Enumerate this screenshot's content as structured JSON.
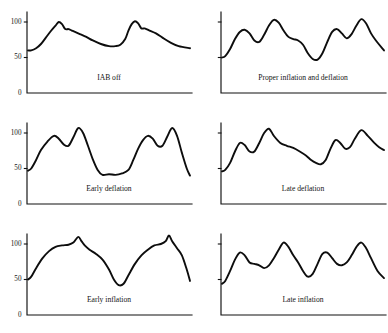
{
  "figure": {
    "title": "",
    "rows": 3,
    "columns": 2
  },
  "chart_data": [
    {
      "type": "line",
      "title": "IAB off",
      "panel_id": "iab-off",
      "position": {
        "row": 0,
        "col": 0
      },
      "xlabel": "",
      "ylabel": "",
      "ylim": [
        0,
        120
      ],
      "xlim": [
        0,
        100
      ],
      "grid": false,
      "legend": "none",
      "y_ticks": [
        0,
        50,
        100
      ],
      "y_tick_labels": [
        "0",
        "50",
        "100"
      ],
      "show_y_labels": true,
      "series": [
        {
          "name": "arterial pressure",
          "x": [
            0,
            2,
            5,
            8,
            11,
            14,
            17,
            19,
            21,
            23,
            25,
            27,
            29,
            32,
            36,
            40,
            45,
            50,
            54,
            57,
            60,
            62,
            64,
            66,
            68,
            70,
            72,
            75,
            79,
            83,
            88,
            93,
            100
          ],
          "values": [
            60,
            60,
            63,
            69,
            78,
            87,
            95,
            100,
            97,
            90,
            90,
            88,
            86,
            83,
            79,
            74,
            69,
            66,
            66,
            68,
            76,
            88,
            97,
            101,
            98,
            91,
            91,
            88,
            84,
            78,
            71,
            66,
            63
          ]
        }
      ]
    },
    {
      "type": "line",
      "title": "Proper inflation and deflation",
      "panel_id": "proper-inflation-and-deflation",
      "position": {
        "row": 0,
        "col": 1
      },
      "xlabel": "",
      "ylabel": "",
      "ylim": [
        0,
        120
      ],
      "xlim": [
        0,
        100
      ],
      "grid": false,
      "legend": "none",
      "y_ticks": [
        0,
        50,
        100
      ],
      "y_tick_labels": [
        "",
        "",
        ""
      ],
      "show_y_labels": false,
      "series": [
        {
          "name": "arterial pressure",
          "x": [
            0,
            2,
            5,
            8,
            11,
            14,
            17,
            20,
            23,
            26,
            29,
            32,
            35,
            38,
            41,
            44,
            47,
            50,
            53,
            56,
            59,
            62,
            65,
            68,
            71,
            74,
            77,
            80,
            83,
            86,
            89,
            92,
            95,
            100
          ],
          "values": [
            50,
            52,
            62,
            76,
            86,
            89,
            84,
            74,
            72,
            82,
            95,
            103,
            99,
            88,
            79,
            76,
            74,
            68,
            56,
            48,
            47,
            56,
            72,
            86,
            90,
            84,
            77,
            83,
            95,
            104,
            98,
            84,
            74,
            60
          ]
        }
      ]
    },
    {
      "type": "line",
      "title": "Early deflation",
      "panel_id": "early-deflation",
      "position": {
        "row": 1,
        "col": 0
      },
      "xlabel": "",
      "ylabel": "",
      "ylim": [
        0,
        120
      ],
      "xlim": [
        0,
        100
      ],
      "grid": false,
      "legend": "none",
      "y_ticks": [
        0,
        50,
        100
      ],
      "y_tick_labels": [
        "0",
        "50",
        "100"
      ],
      "show_y_labels": true,
      "series": [
        {
          "name": "arterial pressure",
          "x": [
            0,
            2,
            5,
            8,
            12,
            16,
            19,
            22,
            25,
            28,
            31,
            34,
            37,
            40,
            43,
            46,
            50,
            54,
            58,
            62,
            65,
            68,
            71,
            74,
            77,
            80,
            83,
            86,
            89,
            92,
            95,
            98,
            100
          ],
          "values": [
            47,
            50,
            62,
            76,
            88,
            96,
            92,
            84,
            82,
            94,
            107,
            100,
            82,
            63,
            48,
            41,
            42,
            41,
            43,
            48,
            62,
            78,
            90,
            96,
            92,
            82,
            82,
            95,
            107,
            96,
            72,
            50,
            40
          ]
        }
      ]
    },
    {
      "type": "line",
      "title": "Late deflation",
      "panel_id": "late-deflation",
      "position": {
        "row": 1,
        "col": 1
      },
      "xlabel": "",
      "ylabel": "",
      "ylim": [
        0,
        120
      ],
      "xlim": [
        0,
        100
      ],
      "grid": false,
      "legend": "none",
      "y_ticks": [
        0,
        50,
        100
      ],
      "y_tick_labels": [
        "",
        "",
        ""
      ],
      "show_y_labels": false,
      "series": [
        {
          "name": "arterial pressure",
          "x": [
            0,
            2,
            5,
            8,
            11,
            14,
            17,
            20,
            23,
            26,
            29,
            32,
            36,
            40,
            44,
            48,
            52,
            55,
            58,
            61,
            64,
            67,
            70,
            73,
            76,
            79,
            82,
            86,
            90,
            94,
            97,
            100
          ],
          "values": [
            46,
            48,
            58,
            74,
            86,
            83,
            74,
            74,
            86,
            100,
            106,
            96,
            86,
            82,
            79,
            74,
            68,
            62,
            58,
            56,
            62,
            78,
            90,
            86,
            78,
            80,
            92,
            104,
            96,
            86,
            80,
            76
          ]
        }
      ]
    },
    {
      "type": "line",
      "title": "Early inflation",
      "panel_id": "early-inflation",
      "position": {
        "row": 2,
        "col": 0
      },
      "xlabel": "",
      "ylabel": "",
      "ylim": [
        0,
        120
      ],
      "xlim": [
        0,
        100
      ],
      "grid": false,
      "legend": "none",
      "y_ticks": [
        0,
        50,
        100
      ],
      "y_tick_labels": [
        "0",
        "50",
        "100"
      ],
      "show_y_labels": true,
      "series": [
        {
          "name": "arterial pressure",
          "x": [
            0,
            2,
            5,
            9,
            13,
            17,
            21,
            25,
            28,
            31,
            33,
            35,
            38,
            42,
            46,
            50,
            53,
            56,
            59,
            62,
            66,
            70,
            74,
            78,
            82,
            85,
            87,
            89,
            92,
            95,
            98,
            100
          ],
          "values": [
            50,
            54,
            66,
            80,
            90,
            96,
            98,
            99,
            102,
            110,
            104,
            98,
            92,
            86,
            78,
            64,
            50,
            42,
            44,
            56,
            72,
            84,
            92,
            98,
            100,
            104,
            112,
            104,
            94,
            84,
            64,
            48
          ]
        }
      ]
    },
    {
      "type": "line",
      "title": "Late inflation",
      "panel_id": "late-inflation",
      "position": {
        "row": 2,
        "col": 1
      },
      "xlabel": "",
      "ylabel": "",
      "ylim": [
        0,
        120
      ],
      "xlim": [
        0,
        100
      ],
      "grid": false,
      "legend": "none",
      "y_ticks": [
        0,
        50,
        100
      ],
      "y_tick_labels": [
        "",
        "",
        ""
      ],
      "show_y_labels": false,
      "series": [
        {
          "name": "arterial pressure",
          "x": [
            0,
            2,
            5,
            8,
            11,
            14,
            17,
            20,
            23,
            26,
            29,
            32,
            35,
            38,
            41,
            44,
            47,
            50,
            53,
            56,
            59,
            62,
            65,
            68,
            71,
            74,
            77,
            80,
            83,
            86,
            89,
            92,
            96,
            100
          ],
          "values": [
            44,
            48,
            62,
            78,
            88,
            84,
            74,
            72,
            70,
            66,
            70,
            80,
            92,
            102,
            96,
            84,
            74,
            62,
            54,
            58,
            72,
            86,
            88,
            80,
            72,
            70,
            74,
            84,
            96,
            102,
            94,
            80,
            62,
            52
          ]
        }
      ]
    }
  ]
}
